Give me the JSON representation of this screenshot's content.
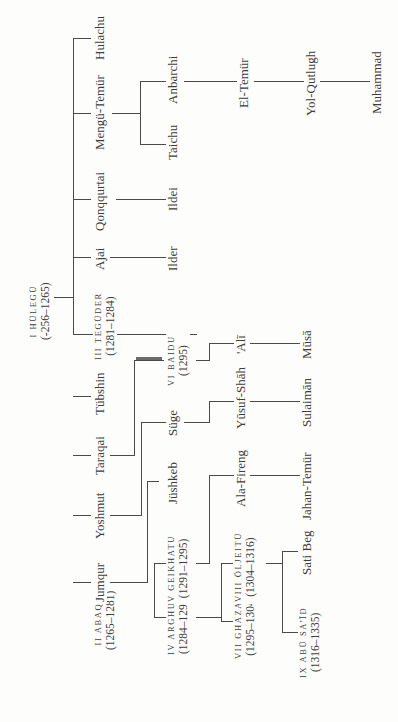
{
  "diagram": {
    "orientation": "rotated-90-ccw",
    "root": {
      "name": "I HÜLEGÜ",
      "dates": "(-256–1265)"
    },
    "generation1": [
      {
        "id": "abaqa",
        "name": "II ABAQA",
        "dates": "(1265–1281)"
      },
      {
        "id": "jumqur",
        "name": "Jumqur"
      },
      {
        "id": "yoshmut",
        "name": "Yoshmut"
      },
      {
        "id": "taraqai",
        "name": "Taraqai"
      },
      {
        "id": "tubshin",
        "name": "Tübshin"
      },
      {
        "id": "teguder",
        "name": "III TEGÜDER",
        "dates": "(1281–1284)"
      },
      {
        "id": "ajai",
        "name": "Ajai"
      },
      {
        "id": "qonqqurtai",
        "name": "Qonqqurtai"
      },
      {
        "id": "mengu_temur",
        "name": "Mengü-Temür"
      },
      {
        "id": "hulachu",
        "name": "Hulachu"
      }
    ],
    "generation2": [
      {
        "id": "arghun",
        "parent": "abaqa",
        "name": "IV ARGHUN",
        "dates": "(1284–1291)"
      },
      {
        "id": "geikhatu",
        "parent": "abaqa",
        "name": "V GEIKHATU",
        "dates": "(1291–1295)"
      },
      {
        "id": "jushkeb",
        "parent": "jumqur",
        "name": "Jüshkeb"
      },
      {
        "id": "suge",
        "parent": "yoshmut",
        "name": "Süge"
      },
      {
        "id": "baidu",
        "parent": "taraqai",
        "name": "VI BAIDU",
        "dates": "(1295)"
      },
      {
        "id": "ilder",
        "parent": "ajai",
        "name": "Ilder"
      },
      {
        "id": "ildei",
        "parent": "qonqqurtai",
        "name": "Ildei"
      },
      {
        "id": "taichu",
        "parent": "mengu_temur",
        "name": "Taichu"
      },
      {
        "id": "anbarchi",
        "parent": "mengu_temur",
        "name": "Anbarchi"
      }
    ],
    "generation3": [
      {
        "id": "ghazan",
        "parent": "arghun",
        "name": "VII GHAZAN",
        "dates": "(1295–1304)"
      },
      {
        "id": "oljeitu",
        "parent": "arghun",
        "name": "VIII ÖLJEITÜ",
        "dates": "(1304–1316)"
      },
      {
        "id": "ala_fireng",
        "parent": "geikhatu",
        "name": "Ala-Fireng"
      },
      {
        "id": "yusuf_shah",
        "parent": "suge",
        "name": "Yūsuf-Shāh"
      },
      {
        "id": "ali",
        "parent": "baidu",
        "name": "'Alī"
      },
      {
        "id": "el_temur",
        "parent": "anbarchi",
        "name": "El-Temür"
      }
    ],
    "generation4": [
      {
        "id": "abu_said",
        "parent": "oljeitu",
        "name": "IX ABŪ SA'ĪD",
        "dates": "(1316–1335)"
      },
      {
        "id": "sati_beg",
        "parent": "oljeitu",
        "name": "Sati Beg"
      },
      {
        "id": "jahan_temur",
        "parent": "ala_fireng",
        "name": "Jahan-Temür"
      },
      {
        "id": "sulaiman",
        "parent": "yusuf_shah",
        "name": "Sulaimān"
      },
      {
        "id": "musa",
        "parent": "ali",
        "name": "Mūsā"
      },
      {
        "id": "yol_qutlugh",
        "parent": "el_temur",
        "name": "Yol-Qutlugh"
      }
    ],
    "generation5": [
      {
        "id": "muhammad",
        "parent": "yol_qutlugh",
        "name": "Muhammad"
      }
    ]
  }
}
